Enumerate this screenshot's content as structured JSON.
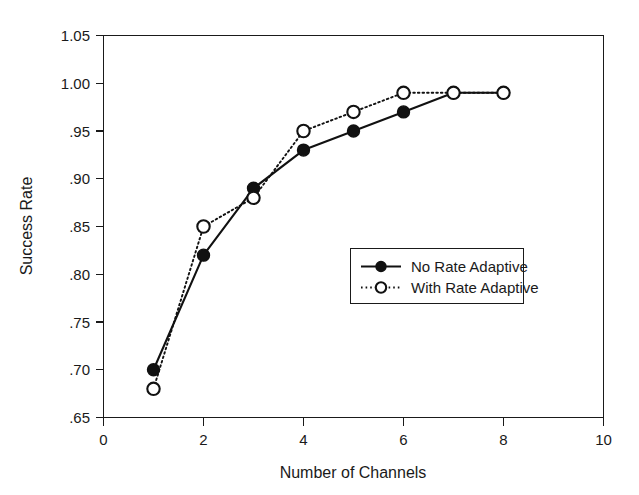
{
  "chart_data": {
    "type": "line",
    "title": "",
    "xlabel": "Number of Channels",
    "ylabel": "Success Rate",
    "xlim": [
      0,
      10
    ],
    "ylim": [
      0.65,
      1.05
    ],
    "grid": false,
    "legend_position": "center-right",
    "x_ticks": [
      "0",
      "2",
      "4",
      "6",
      "8",
      "10"
    ],
    "x_tick_values": [
      0,
      2,
      4,
      6,
      8,
      10
    ],
    "y_ticks": [
      ".65",
      ".70",
      ".75",
      ".80",
      ".85",
      ".90",
      ".95",
      "1.00",
      "1.05"
    ],
    "y_tick_values": [
      0.65,
      0.7,
      0.75,
      0.8,
      0.85,
      0.9,
      0.95,
      1.0,
      1.05
    ],
    "x": [
      1,
      2,
      3,
      4,
      5,
      6,
      7,
      8
    ],
    "series": [
      {
        "name": "No Rate Adaptive",
        "marker": "filled-circle",
        "linestyle": "solid",
        "color": "#111111",
        "values": [
          0.7,
          0.82,
          0.89,
          0.93,
          0.95,
          0.97,
          0.99,
          0.99
        ]
      },
      {
        "name": "With Rate Adaptive",
        "marker": "open-circle",
        "linestyle": "dotted",
        "color": "#111111",
        "values": [
          0.68,
          0.85,
          0.88,
          0.95,
          0.97,
          0.99,
          0.99,
          0.99
        ]
      }
    ]
  },
  "legend": {
    "entries": [
      {
        "label": "No Rate Adaptive"
      },
      {
        "label": "With Rate Adaptive"
      }
    ]
  },
  "colors": {
    "foreground": "#111111",
    "background": "#ffffff"
  }
}
